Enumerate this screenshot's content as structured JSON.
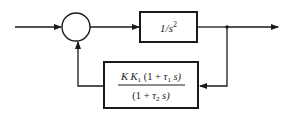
{
  "diagram": {
    "type": "feedback-block-diagram",
    "colors": {
      "line": "#1a1a1a",
      "background": "#ffffff"
    },
    "summing_junction": {
      "label": ""
    },
    "forward_block": {
      "label_prefix": "1/s",
      "label_exponent": "2"
    },
    "feedback_block": {
      "numerator": {
        "K": "K",
        "K1": "K",
        "K1_sub": "1",
        "open": "(1 + ",
        "tau": "τ",
        "tau_sub": "1",
        "close": " s)"
      },
      "denominator": {
        "open": "(1 + ",
        "tau": "τ",
        "tau_sub": "2",
        "close": " s)"
      }
    },
    "signals": {
      "input": "",
      "output": ""
    }
  }
}
